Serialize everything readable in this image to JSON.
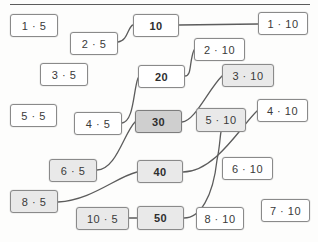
{
  "page": {
    "divider": "horizontal-rule"
  },
  "colors": {
    "card_fill": "#ffffff",
    "card_fill_shaded": "#e9e9e9",
    "card_fill_shaded_dark": "#cfcfcf",
    "card_border": "#8a8a8a",
    "text": "#3a3a3a",
    "line": "#5c5c5c"
  },
  "cards": [
    {
      "id": "c-1x5",
      "label": "1 · 5",
      "x": 10,
      "y": 14,
      "w": 48,
      "h": 23,
      "fill": "plain"
    },
    {
      "id": "c-2x5",
      "label": "2 · 5",
      "x": 70,
      "y": 32,
      "w": 48,
      "h": 23,
      "fill": "plain"
    },
    {
      "id": "c-3x5",
      "label": "3 · 5",
      "x": 40,
      "y": 63,
      "w": 48,
      "h": 23,
      "fill": "plain"
    },
    {
      "id": "c-5x5",
      "label": "5 · 5",
      "x": 10,
      "y": 104,
      "w": 47,
      "h": 23,
      "fill": "plain"
    },
    {
      "id": "c-4x5",
      "label": "4 · 5",
      "x": 74,
      "y": 112,
      "w": 48,
      "h": 23,
      "fill": "plain"
    },
    {
      "id": "c-6x5",
      "label": "6 · 5",
      "x": 49,
      "y": 159,
      "w": 48,
      "h": 23,
      "fill": "shaded"
    },
    {
      "id": "c-8x5",
      "label": "8 · 5",
      "x": 10,
      "y": 190,
      "w": 48,
      "h": 23,
      "fill": "shaded"
    },
    {
      "id": "c-10x5",
      "label": "10 · 5",
      "x": 76,
      "y": 207,
      "w": 53,
      "h": 23,
      "fill": "shaded"
    },
    {
      "id": "c-10",
      "label": "10",
      "x": 133,
      "y": 14,
      "w": 46,
      "h": 23,
      "fill": "plain",
      "kind": "product"
    },
    {
      "id": "c-20",
      "label": "20",
      "x": 138,
      "y": 65,
      "w": 47,
      "h": 23,
      "fill": "plain",
      "kind": "product"
    },
    {
      "id": "c-30",
      "label": "30",
      "x": 135,
      "y": 110,
      "w": 47,
      "h": 23,
      "fill": "shaded-dark",
      "kind": "product"
    },
    {
      "id": "c-40",
      "label": "40",
      "x": 137,
      "y": 160,
      "w": 46,
      "h": 23,
      "fill": "shaded",
      "kind": "product"
    },
    {
      "id": "c-50",
      "label": "50",
      "x": 137,
      "y": 206,
      "w": 47,
      "h": 24,
      "fill": "shaded",
      "kind": "product"
    },
    {
      "id": "c-1x10",
      "label": "1 · 10",
      "x": 258,
      "y": 12,
      "w": 50,
      "h": 23,
      "fill": "plain"
    },
    {
      "id": "c-2x10",
      "label": "2 · 10",
      "x": 194,
      "y": 38,
      "w": 51,
      "h": 23,
      "fill": "plain"
    },
    {
      "id": "c-3x10",
      "label": "3 · 10",
      "x": 222,
      "y": 64,
      "w": 52,
      "h": 23,
      "fill": "shaded"
    },
    {
      "id": "c-4x10",
      "label": "4 · 10",
      "x": 257,
      "y": 99,
      "w": 51,
      "h": 23,
      "fill": "plain"
    },
    {
      "id": "c-5x10",
      "label": "5 · 10",
      "x": 196,
      "y": 108,
      "w": 50,
      "h": 24,
      "fill": "shaded"
    },
    {
      "id": "c-6x10",
      "label": "6 · 10",
      "x": 222,
      "y": 157,
      "w": 51,
      "h": 23,
      "fill": "plain"
    },
    {
      "id": "c-7x10",
      "label": "7 · 10",
      "x": 261,
      "y": 199,
      "w": 49,
      "h": 23,
      "fill": "plain"
    },
    {
      "id": "c-8x10",
      "label": "8 · 10",
      "x": 196,
      "y": 207,
      "w": 48,
      "h": 23,
      "fill": "plain"
    }
  ],
  "connections": [
    {
      "id": "k-2x5-10",
      "from": "c-2x5",
      "to": "c-10",
      "path": "M118,42 C128,41 128,26 133,25"
    },
    {
      "id": "k-10-1x10",
      "from": "c-10",
      "to": "c-1x10",
      "path": "M179,25 L258,24"
    },
    {
      "id": "k-20-2x10",
      "from": "c-20",
      "to": "c-2x10",
      "path": "M185,76 C192,76 189,62 194,50"
    },
    {
      "id": "k-4x5-20",
      "from": "c-4x5",
      "to": "c-20",
      "path": "M122,123 C134,121 133,92 138,78"
    },
    {
      "id": "k-6x5-30",
      "from": "c-6x5",
      "to": "c-30",
      "path": "M97,170 C116,170 124,133 135,122"
    },
    {
      "id": "k-30-3x10",
      "from": "c-30",
      "to": "c-3x10",
      "path": "M182,122 C195,121 208,90 222,76"
    },
    {
      "id": "k-8x5-40",
      "from": "c-8x5",
      "to": "c-40",
      "path": "M58,202 C92,200 116,177 137,172"
    },
    {
      "id": "k-40-4x10",
      "from": "c-40",
      "to": "c-4x10",
      "path": "M183,172 C215,172 241,126 257,111"
    },
    {
      "id": "k-10x5-50",
      "from": "c-10x5",
      "to": "c-50",
      "path": "M129,218 L137,218"
    },
    {
      "id": "k-50-5x10",
      "from": "c-50",
      "to": "c-5x10",
      "path": "M184,218 C200,218 213,197 217,160 C220,146 220,136 221,132"
    }
  ]
}
